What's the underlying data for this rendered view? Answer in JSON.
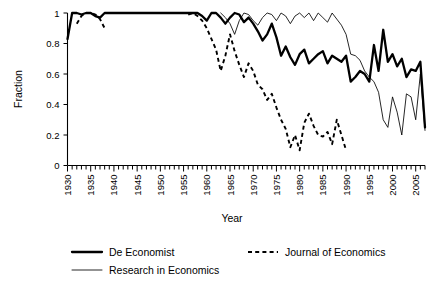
{
  "chart_data": {
    "type": "line",
    "title": "",
    "xlabel": "Year",
    "ylabel": "Fraction",
    "xlim": [
      1930,
      2007
    ],
    "ylim": [
      0,
      1
    ],
    "xticks": [
      1930,
      1935,
      1940,
      1945,
      1950,
      1955,
      1960,
      1965,
      1970,
      1975,
      1980,
      1985,
      1990,
      1995,
      2000,
      2005
    ],
    "xtick_labels": [
      "1930",
      "1935",
      "1940",
      "1945",
      "1950",
      "1955",
      "1960",
      "1965",
      "1970",
      "1975",
      "1980",
      "1985",
      "1990",
      "1995",
      "2000",
      "2005"
    ],
    "minor_xtick_interval": 1,
    "yticks": [
      0,
      0.2,
      0.4,
      0.6,
      0.8,
      1
    ],
    "ytick_labels": [
      "0",
      "0.2",
      "0.4",
      "0.6",
      "0.8",
      "1"
    ],
    "grid": false,
    "legend_position": "below",
    "series": [
      {
        "name": "De Economist",
        "style": "solid-thick",
        "color": "#000000",
        "x": [
          1930,
          1931,
          1932,
          1933,
          1934,
          1935,
          1936,
          1937,
          1938,
          1939,
          1940,
          1941,
          1942,
          1943,
          1944,
          1945,
          1946,
          1947,
          1948,
          1949,
          1950,
          1951,
          1952,
          1953,
          1954,
          1955,
          1956,
          1957,
          1958,
          1959,
          1960,
          1961,
          1962,
          1963,
          1964,
          1965,
          1966,
          1967,
          1968,
          1969,
          1970,
          1971,
          1972,
          1973,
          1974,
          1975,
          1976,
          1977,
          1978,
          1979,
          1980,
          1981,
          1982,
          1983,
          1984,
          1985,
          1986,
          1987,
          1988,
          1989,
          1990,
          1991,
          1992,
          1993,
          1994,
          1995,
          1996,
          1997,
          1998,
          1999,
          2000,
          2001,
          2002,
          2003,
          2004,
          2005,
          2006,
          2007
        ],
        "y": [
          0.83,
          1,
          1,
          0.99,
          1,
          1,
          0.98,
          0.97,
          1,
          1,
          1,
          1,
          1,
          1,
          1,
          1,
          1,
          1,
          1,
          1,
          1,
          1,
          1,
          1,
          1,
          1,
          1,
          1,
          1,
          0.98,
          0.95,
          1,
          1,
          0.97,
          0.93,
          0.97,
          1,
          0.99,
          0.94,
          0.97,
          0.93,
          0.88,
          0.82,
          0.86,
          0.93,
          0.84,
          0.72,
          0.78,
          0.71,
          0.66,
          0.73,
          0.76,
          0.67,
          0.7,
          0.73,
          0.75,
          0.67,
          0.72,
          0.7,
          0.68,
          0.72,
          0.55,
          0.58,
          0.62,
          0.6,
          0.55,
          0.79,
          0.62,
          0.89,
          0.68,
          0.73,
          0.65,
          0.7,
          0.58,
          0.63,
          0.62,
          0.68,
          0.25
        ]
      },
      {
        "name": "Journal of Economics",
        "style": "dashed",
        "color": "#000000",
        "x": [
          1932,
          1933,
          1934,
          1935,
          1936,
          1937,
          1938,
          1939,
          1940,
          1941,
          1942,
          1943,
          1944,
          1945,
          1946,
          1947,
          1948,
          1949,
          1950,
          1951,
          1952,
          1953,
          1954,
          1955,
          1956,
          1957,
          1958,
          1959,
          1960,
          1961,
          1962,
          1963,
          1964,
          1965,
          1966,
          1967,
          1968,
          1969,
          1970,
          1971,
          1972,
          1973,
          1974,
          1975,
          1976,
          1977,
          1978,
          1979,
          1980,
          1981,
          1982,
          1983,
          1984,
          1985,
          1986,
          1987,
          1988,
          1989,
          1990
        ],
        "y": [
          0.93,
          0.98,
          1,
          1,
          0.99,
          0.96,
          0.9,
          null,
          null,
          null,
          null,
          null,
          null,
          null,
          null,
          null,
          null,
          null,
          null,
          null,
          null,
          null,
          null,
          null,
          0.99,
          1,
          0.98,
          0.95,
          0.9,
          0.83,
          0.76,
          0.62,
          0.72,
          0.86,
          0.75,
          0.66,
          0.58,
          0.67,
          0.62,
          0.53,
          0.5,
          0.43,
          0.47,
          0.38,
          0.3,
          0.24,
          0.12,
          0.2,
          0.1,
          0.28,
          0.34,
          0.26,
          0.2,
          0.19,
          0.22,
          0.14,
          0.3,
          0.2,
          0.1
        ]
      },
      {
        "name": "Research in Economics",
        "style": "solid-thin",
        "color": "#000000",
        "x": [
          1963,
          1964,
          1965,
          1966,
          1967,
          1968,
          1969,
          1970,
          1971,
          1972,
          1973,
          1974,
          1975,
          1976,
          1977,
          1978,
          1979,
          1980,
          1981,
          1982,
          1983,
          1984,
          1985,
          1986,
          1987,
          1988,
          1989,
          1990,
          1991,
          1992,
          1993,
          1994,
          1995,
          1996,
          1997,
          1998,
          1999,
          2000,
          2001,
          2002,
          2003,
          2004,
          2005,
          2006,
          2007
        ],
        "y": [
          1,
          0.97,
          0.93,
          0.86,
          0.95,
          1,
          0.99,
          0.95,
          0.92,
          0.97,
          1,
          0.99,
          0.95,
          1,
          0.98,
          0.93,
          0.98,
          1,
          0.97,
          1,
          0.95,
          1,
          0.97,
          0.94,
          1,
          0.96,
          0.92,
          0.86,
          0.73,
          0.72,
          0.69,
          0.62,
          0.58,
          0.55,
          0.48,
          0.3,
          0.25,
          0.45,
          0.35,
          0.2,
          0.47,
          0.45,
          0.3,
          0.6,
          0.23
        ]
      }
    ]
  },
  "legend": {
    "items": [
      {
        "label": "De Economist",
        "style": "solid-thick"
      },
      {
        "label": "Journal of Economics",
        "style": "dashed"
      },
      {
        "label": "Research in Economics",
        "style": "solid-thin"
      }
    ]
  }
}
